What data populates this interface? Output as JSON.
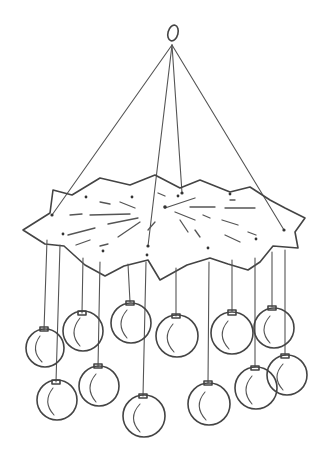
{
  "illustration": {
    "subject": "hanging star mobile with ornament balls",
    "style": "black line drawing on white",
    "colors": {
      "ink": "#444444",
      "background": "#ffffff"
    },
    "elements": {
      "hook": "loop at top",
      "strings_to_star": 4,
      "star": "paper star with fold lines",
      "ornaments": 12
    }
  }
}
